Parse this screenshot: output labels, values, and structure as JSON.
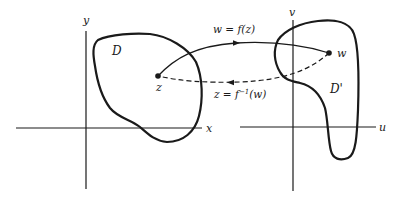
{
  "diagram": {
    "z_plane": {
      "horizontal_axis_label": "x",
      "vertical_axis_label": "y",
      "region_label": "D",
      "point_label": "z"
    },
    "w_plane": {
      "horizontal_axis_label": "u",
      "vertical_axis_label": "v",
      "region_label": "D'",
      "point_label": "w"
    },
    "mapping": {
      "forward_label": "w = f(z)",
      "inverse_label_prefix": "z = f",
      "inverse_label_exponent": "−1",
      "inverse_label_suffix": "(w)"
    },
    "colors": {
      "ink": "#1a1a1a",
      "background": "#ffffff"
    }
  }
}
